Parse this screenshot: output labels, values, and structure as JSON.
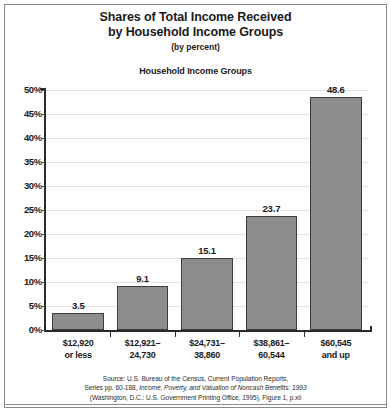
{
  "figure": {
    "title_line1": "Shares of Total Income Received",
    "title_line2": "by Household Income Groups",
    "subtitle": "(by percent)",
    "group_header": "Household Income Groups",
    "source_line1": "Source: U.S. Bureau of the Census, Current Population Reports,",
    "source_line2_prefix": "Series pp. 60-188, ",
    "source_line2_italic": "Income, Poverty, and Valuation of Noncash Benefits: 1993",
    "source_line3": "(Washington, D.C.: U.S. Government Printing Office, 1995), Figure 1, p.xii"
  },
  "colors": {
    "bar_fill": "#8c8c8c",
    "bar_border": "#3d3d3d",
    "axis": "#2b2b2b",
    "gridline": "#e2e2e2",
    "frame": "#8a8a8a",
    "text": "#1a1a1a"
  },
  "chart_data": {
    "type": "bar",
    "title": "Shares of Total Income Received by Household Income Groups (by percent)",
    "xlabel": "Household Income Groups",
    "ylabel": "",
    "ylim": [
      0,
      50
    ],
    "ytick_step": 5,
    "grid": true,
    "legend": "none",
    "categories": [
      "$12,920 or less",
      "$12,921–24,730",
      "$24,731–38,860",
      "$38,861–60,544",
      "$60,545 and up"
    ],
    "category_lines": [
      [
        "$12,920",
        "or less"
      ],
      [
        "$12,921–",
        "24,730"
      ],
      [
        "$24,731–",
        "38,860"
      ],
      [
        "$38,861–",
        "60,544"
      ],
      [
        "$60,545",
        "and up"
      ]
    ],
    "values": [
      3.5,
      9.1,
      15.1,
      23.7,
      48.6
    ],
    "value_labels": [
      "3.5",
      "9.1",
      "15.1",
      "23.7",
      "48.6"
    ],
    "ytick_labels": [
      "50%",
      "45%",
      "40%",
      "35%",
      "30%",
      "25%",
      "20%",
      "15%",
      "10%",
      "5%",
      "0%"
    ],
    "ytick_values": [
      50,
      45,
      40,
      35,
      30,
      25,
      20,
      15,
      10,
      5,
      0
    ]
  }
}
